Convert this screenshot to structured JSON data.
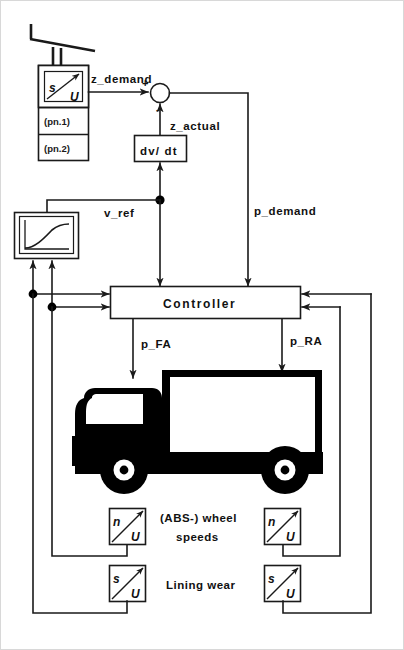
{
  "diagram": {
    "type": "block-diagram",
    "colors": {
      "ink": "#1a1a1a",
      "fill": "#ffffff",
      "vehicle": "#000000"
    }
  },
  "signals": {
    "z_demand": "z_demand",
    "z_actual": "z_actual",
    "v_ref": "v_ref",
    "p_demand": "p_demand",
    "p_FA": "p_FA",
    "p_RA": "p_RA"
  },
  "summing_junction": {
    "name": "summing-junction",
    "plus": "+",
    "minus": "-"
  },
  "blocks": {
    "controller": {
      "label": "Controller"
    },
    "derivative": {
      "label": "dv/ dt"
    },
    "reference_curve": {
      "label": ""
    }
  },
  "pedal_sensor": {
    "name": "brake-pedal-travel-sensor",
    "input_symbol": "s",
    "output_symbol": "U",
    "ports": [
      {
        "label": "(pn.1)"
      },
      {
        "label": "(pn.2)"
      }
    ]
  },
  "wheel_speed": {
    "group_label_line1": "(ABS-) wheel",
    "group_label_line2": "speeds",
    "sensors": [
      {
        "name": "wheel-speed-sensor-left",
        "input_symbol": "n",
        "output_symbol": "U"
      },
      {
        "name": "wheel-speed-sensor-right",
        "input_symbol": "n",
        "output_symbol": "U"
      }
    ]
  },
  "lining_wear": {
    "group_label": "Lining wear",
    "sensors": [
      {
        "name": "lining-wear-sensor-left",
        "input_symbol": "s",
        "output_symbol": "U"
      },
      {
        "name": "lining-wear-sensor-right",
        "input_symbol": "s",
        "output_symbol": "U"
      }
    ]
  },
  "vehicle": {
    "name": "truck-illustration",
    "label": ""
  }
}
